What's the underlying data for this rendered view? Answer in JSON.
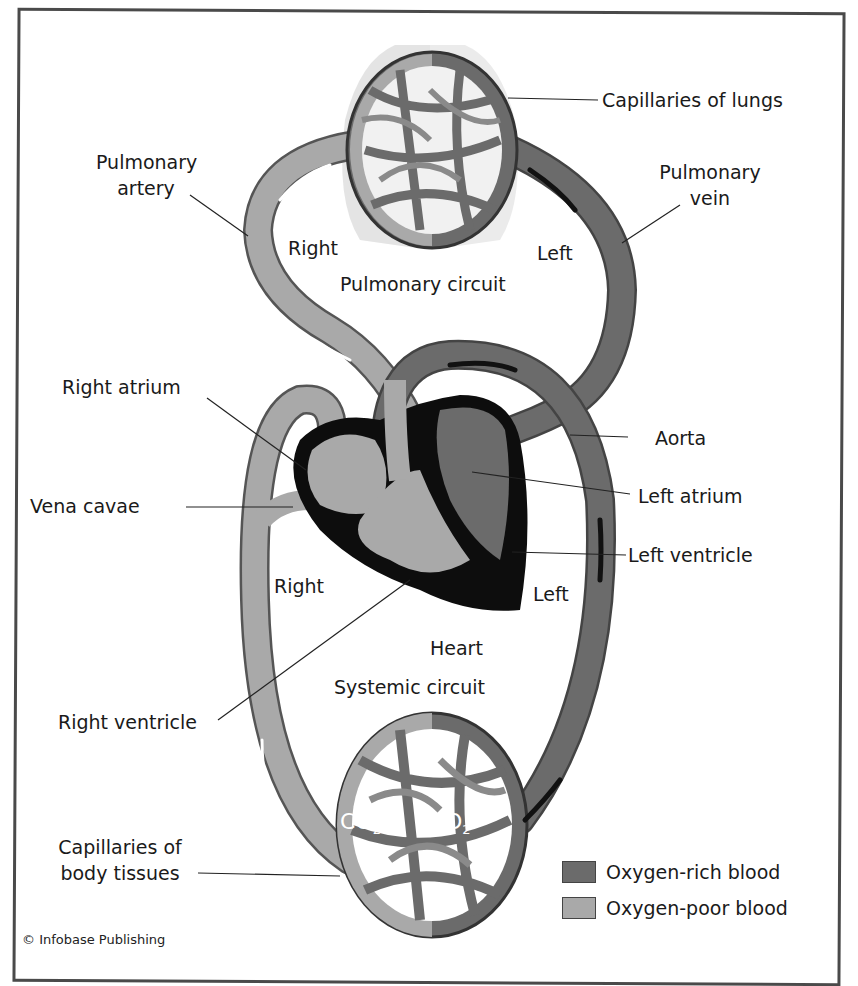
{
  "colors": {
    "oxygen_rich": "#6b6b6b",
    "oxygen_poor": "#a9a9a9",
    "heart_outline": "#0d0d0d",
    "frame": "#4a4a4a"
  },
  "labels": {
    "capillaries_lungs": "Capillaries of lungs",
    "pulmonary_artery_1": "Pulmonary",
    "pulmonary_artery_2": "artery",
    "pulmonary_vein_1": "Pulmonary",
    "pulmonary_vein_2": "vein",
    "right_top": "Right",
    "left_top": "Left",
    "pulmonary_circuit": "Pulmonary circuit",
    "right_atrium": "Right atrium",
    "aorta": "Aorta",
    "left_atrium": "Left atrium",
    "vena_cavae": "Vena cavae",
    "left_ventricle": "Left ventricle",
    "right_bottom": "Right",
    "left_bottom": "Left",
    "heart": "Heart",
    "systemic_circuit": "Systemic circuit",
    "right_ventricle": "Right ventricle",
    "co2": "CO",
    "co2_sub": "2",
    "o2": "O",
    "o2_sub": "2",
    "capillaries_body_1": "Capillaries of",
    "capillaries_body_2": "body tissues"
  },
  "legend": [
    {
      "label": "Oxygen-rich blood",
      "color": "#6b6b6b"
    },
    {
      "label": "Oxygen-poor blood",
      "color": "#a9a9a9"
    }
  ],
  "copyright": "© Infobase Publishing"
}
